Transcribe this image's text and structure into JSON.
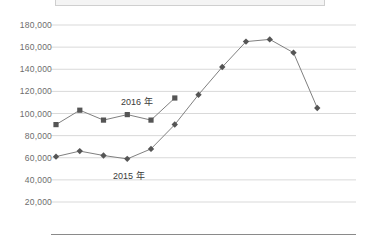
{
  "chart_data": {
    "type": "line",
    "title": "",
    "subtitle": "",
    "xlabel": "",
    "ylabel": "",
    "ylim": [
      0,
      180000
    ],
    "y_ticks": [
      180000,
      160000,
      140000,
      120000,
      100000,
      80000,
      60000,
      40000,
      20000
    ],
    "y_tick_labels": [
      "180,000",
      "160,000",
      "140,000",
      "120,000",
      "100,000",
      "80,000",
      "60,000",
      "40,000",
      "20,000"
    ],
    "x_tick_labels": [],
    "grid": "horizontal",
    "legend_position": "inline-annotation",
    "x": [
      1,
      2,
      3,
      4,
      5,
      6,
      7,
      8,
      9,
      10,
      11,
      12,
      13
    ],
    "series": [
      {
        "name": "2015 年",
        "marker": "diamond",
        "color": "#555555",
        "line_color": "#808080",
        "values": [
          61000,
          66000,
          62000,
          59000,
          68000,
          90000,
          117000,
          142000,
          165000,
          167000,
          155000,
          105000,
          null
        ]
      },
      {
        "name": "2016 年",
        "marker": "square",
        "color": "#555555",
        "line_color": "#808080",
        "values": [
          90000,
          103000,
          94000,
          99000,
          94000,
          114000,
          null,
          null,
          null,
          null,
          null,
          null,
          null
        ]
      }
    ],
    "annotations": [
      {
        "text": "2016 年",
        "x": 3.6,
        "y": 111000
      },
      {
        "text": "2015 年",
        "x": 3.3,
        "y": 47000
      }
    ]
  },
  "colors": {
    "grid": "#d9d9d9",
    "axis": "#8a8a8a",
    "tick_text": "#6d6d6d",
    "marker": "#555555",
    "line": "#808080",
    "legend_box_fill": "#f4f4f4",
    "legend_box_border": "#cfcfcf",
    "background": "#ffffff"
  },
  "labels": {
    "series_2016": "2016 年",
    "series_2015": "2015 年"
  }
}
